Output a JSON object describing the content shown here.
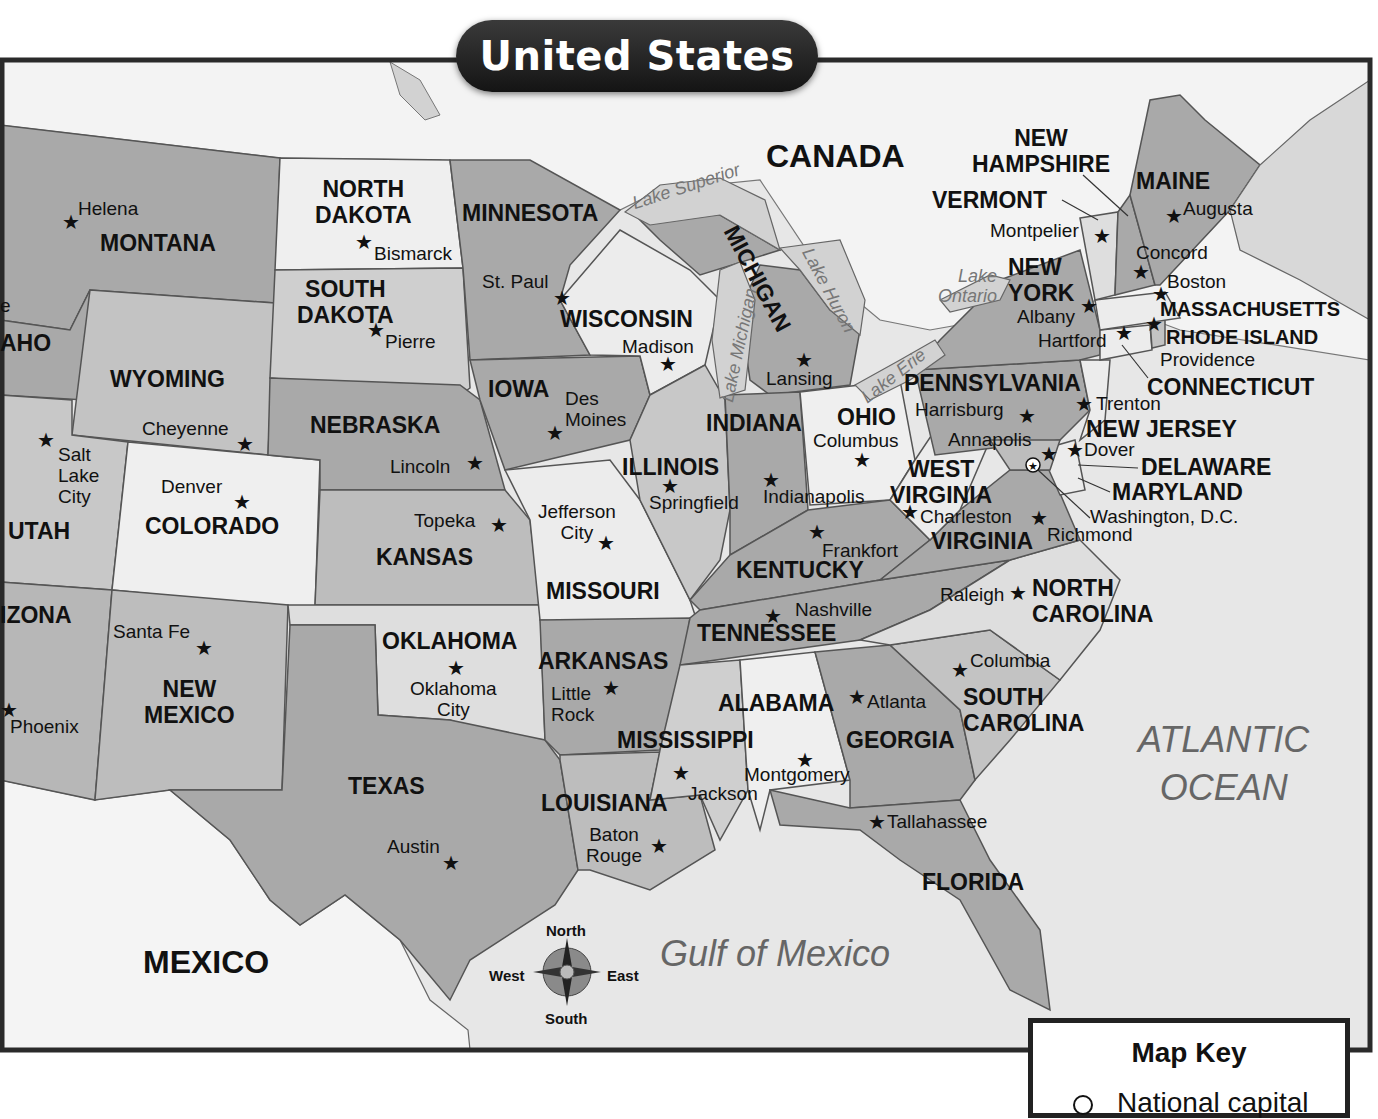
{
  "title": "United States",
  "colors": {
    "frame": "#2a2a2a",
    "water": "#e6e6e6",
    "foreign_land": "#f4f4f4",
    "state_dark": "#a9a9a9",
    "state_mid": "#c4c4c4",
    "state_light": "#ececec",
    "lake": "#d0d0d0"
  },
  "countries": {
    "canada": "CANADA",
    "mexico": "MEXICO"
  },
  "water_bodies": {
    "atlantic": "ATLANTIC\nOCEAN",
    "gulf": "Gulf of Mexico",
    "lake_superior": "Lake Superior",
    "lake_michigan": "Lake Michigan",
    "lake_huron": "Lake Huron",
    "lake_erie": "Lake Erie",
    "lake_ontario": "Lake\nOntario"
  },
  "states": {
    "montana": "MONTANA",
    "idaho": "AHO",
    "wyoming": "WYOMING",
    "utah": "UTAH",
    "arizona": "IZONA",
    "colorado": "COLORADO",
    "new_mexico": "NEW\nMEXICO",
    "north_dakota": "NORTH\nDAKOTA",
    "south_dakota": "SOUTH\nDAKOTA",
    "nebraska": "NEBRASKA",
    "kansas": "KANSAS",
    "oklahoma": "OKLAHOMA",
    "texas": "TEXAS",
    "minnesota": "MINNESOTA",
    "iowa": "IOWA",
    "missouri": "MISSOURI",
    "arkansas": "ARKANSAS",
    "louisiana": "LOUISIANA",
    "wisconsin": "WISCONSIN",
    "michigan": "MICHIGAN",
    "illinois": "ILLINOIS",
    "indiana": "INDIANA",
    "ohio": "OHIO",
    "kentucky": "KENTUCKY",
    "tennessee": "TENNESSEE",
    "mississippi": "MISSISSIPPI",
    "alabama": "ALABAMA",
    "georgia": "GEORGIA",
    "florida": "FLORIDA",
    "south_carolina": "SOUTH\nCAROLINA",
    "north_carolina": "NORTH\nCAROLINA",
    "virginia": "VIRGINIA",
    "west_virginia": "WEST\nVIRGINIA",
    "pennsylvania": "PENNSYLVANIA",
    "new_york": "NEW\nYORK",
    "new_jersey": "NEW JERSEY",
    "delaware": "DELAWARE",
    "maryland": "MARYLAND",
    "connecticut": "CONNECTICUT",
    "rhode_island": "RHODE ISLAND",
    "massachusetts": "MASSACHUSETTS",
    "vermont": "VERMONT",
    "new_hampshire": "NEW\nHAMPSHIRE",
    "maine": "MAINE"
  },
  "capitals": {
    "helena": "Helena",
    "boise_partial": "e",
    "cheyenne": "Cheyenne",
    "salt_lake_city": "Salt\nLake\nCity",
    "denver": "Denver",
    "phoenix": "Phoenix",
    "santa_fe": "Santa Fe",
    "bismarck": "Bismarck",
    "pierre": "Pierre",
    "lincoln": "Lincoln",
    "topeka": "Topeka",
    "oklahoma_city": "Oklahoma\nCity",
    "austin": "Austin",
    "st_paul": "St. Paul",
    "des_moines": "Des\nMoines",
    "jefferson_city": "Jefferson\nCity",
    "little_rock": "Little\nRock",
    "baton_rouge": "Baton\nRouge",
    "madison": "Madison",
    "lansing": "Lansing",
    "springfield": "Springfield",
    "indianapolis": "Indianapolis",
    "columbus": "Columbus",
    "frankfort": "Frankfort",
    "nashville": "Nashville",
    "jackson": "Jackson",
    "montgomery": "Montgomery",
    "atlanta": "Atlanta",
    "tallahassee": "Tallahassee",
    "columbia": "Columbia",
    "raleigh": "Raleigh",
    "richmond": "Richmond",
    "charleston": "Charleston",
    "harrisburg": "Harrisburg",
    "annapolis": "Annapolis",
    "dover": "Dover",
    "trenton": "Trenton",
    "washington_dc": "Washington, D.C.",
    "hartford": "Hartford",
    "providence": "Providence",
    "boston": "Boston",
    "albany": "Albany",
    "montpelier": "Montpelier",
    "concord": "Concord",
    "augusta": "Augusta"
  },
  "compass": {
    "north": "North",
    "south": "South",
    "east": "East",
    "west": "West"
  },
  "map_key": {
    "title": "Map Key",
    "items": [
      {
        "symbol": "national-capital-symbol",
        "label": "National capital"
      }
    ]
  }
}
